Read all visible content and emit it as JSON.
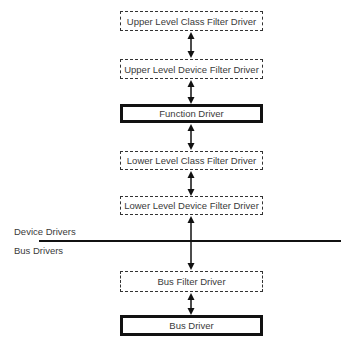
{
  "diagram": {
    "boxes": [
      {
        "id": "upper-class-filter",
        "label": "Upper Level Class Filter Driver",
        "style": "dashed"
      },
      {
        "id": "upper-device-filter",
        "label": "Upper Level Device Filter Driver",
        "style": "dashed"
      },
      {
        "id": "function-driver",
        "label": "Function Driver",
        "style": "solid"
      },
      {
        "id": "lower-class-filter",
        "label": "Lower Level Class Filter Driver",
        "style": "dashed"
      },
      {
        "id": "lower-device-filter",
        "label": "Lower Level Device Filter Driver",
        "style": "dashed"
      },
      {
        "id": "bus-filter",
        "label": "Bus Filter Driver",
        "style": "dashed"
      },
      {
        "id": "bus-driver",
        "label": "Bus Driver",
        "style": "solid"
      }
    ],
    "divider": {
      "above_label": "Device Drivers",
      "below_label": "Bus Drivers"
    },
    "connector": "bidirectional-arrow"
  }
}
